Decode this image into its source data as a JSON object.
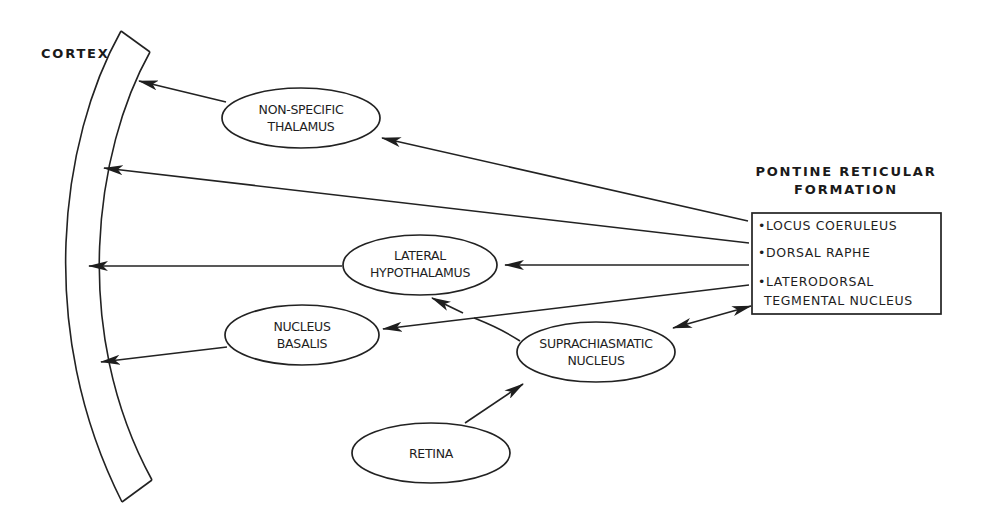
{
  "diagram": {
    "colors": {
      "ink": "#222222",
      "background": "#ffffff"
    },
    "cortex": {
      "label": "CORTEX"
    },
    "pontine": {
      "title_line1": "PONTINE RETICULAR",
      "title_line2": "FORMATION",
      "items": [
        "•LOCUS COERULEUS",
        "•DORSAL RAPHE",
        "•LATERODORSAL",
        "TEGMENTAL NUCLEUS"
      ]
    },
    "nodes": {
      "thalamus": {
        "line1": "NON-SPECIFIC",
        "line2": "THALAMUS"
      },
      "hypothalamus": {
        "line1": "LATERAL",
        "line2": "HYPOTHALAMUS"
      },
      "basalis": {
        "line1": "NUCLEUS",
        "line2": "BASALIS"
      },
      "scn": {
        "line1": "SUPRACHIASMATIC",
        "line2": "NUCLEUS"
      },
      "retina": {
        "line1": "RETINA"
      }
    },
    "edges": [
      {
        "from": "pontine",
        "to": "thalamus"
      },
      {
        "from": "thalamus",
        "to": "cortex"
      },
      {
        "from": "pontine",
        "to": "cortex"
      },
      {
        "from": "pontine",
        "to": "hypothalamus"
      },
      {
        "from": "hypothalamus",
        "to": "cortex"
      },
      {
        "from": "pontine",
        "to": "basalis"
      },
      {
        "from": "basalis",
        "to": "cortex"
      },
      {
        "from": "scn",
        "to": "hypothalamus"
      },
      {
        "from": "scn",
        "to": "pontine",
        "bidirectional": true
      },
      {
        "from": "retina",
        "to": "scn"
      }
    ]
  }
}
